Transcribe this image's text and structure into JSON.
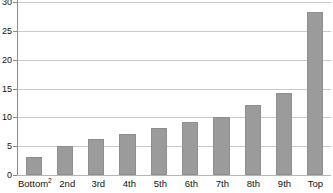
{
  "chart_data": {
    "type": "bar",
    "title": "",
    "subtitle": "",
    "xlabel": "",
    "ylabel": "",
    "categories": [
      "Bottom",
      "2nd",
      "3rd",
      "4th",
      "5th",
      "6th",
      "7th",
      "8th",
      "9th",
      "Top"
    ],
    "category_superscripts": [
      "2",
      "",
      "",
      "",
      "",
      "",
      "",
      "",
      "",
      ""
    ],
    "values": [
      3.1,
      5.1,
      6.2,
      7.1,
      8.2,
      9.2,
      10.1,
      12.1,
      14.2,
      28.3
    ],
    "ylim": [
      0,
      30
    ],
    "yticks": [
      0,
      5,
      10,
      15,
      20,
      25,
      30
    ],
    "ytick_labels": [
      "0",
      "5",
      "10",
      "15",
      "20",
      "25",
      "30"
    ],
    "grid": true,
    "grid_axis": "y",
    "legend": false,
    "legend_position": "none",
    "bar_color": "#9b9b9b",
    "bar_edge_color": "#8e8e8e",
    "grid_color": "#c9c9c9",
    "axis_color": "#8a8a8a",
    "background_color": "#ffffff",
    "text_color": "#111111"
  }
}
